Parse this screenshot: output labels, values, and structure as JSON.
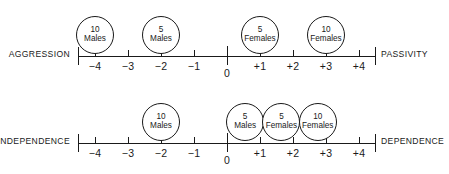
{
  "chart_data": {
    "type": "scatter",
    "title": "",
    "axis_range": [
      -4.5,
      4.5
    ],
    "grid": false,
    "legend": "none",
    "scales": [
      {
        "id": "aggression-passivity",
        "left_pole": "AGGRESSION",
        "right_pole": "PASSIVITY",
        "tick_values": [
          -4,
          -3,
          -2,
          -1,
          0,
          1,
          2,
          3,
          4
        ],
        "tick_labels": [
          "−4",
          "−3",
          "−2",
          "−1",
          "0",
          "+1",
          "+2",
          "+3",
          "+4"
        ],
        "groups": [
          {
            "count": "10",
            "group": "Males",
            "position": -4
          },
          {
            "count": "5",
            "group": "Males",
            "position": -2
          },
          {
            "count": "5",
            "group": "Females",
            "position": 1
          },
          {
            "count": "10",
            "group": "Females",
            "position": 3
          }
        ]
      },
      {
        "id": "independence-dependence",
        "left_pole": "INDEPENDENCE",
        "right_pole": "DEPENDENCE",
        "tick_values": [
          -4,
          -3,
          -2,
          -1,
          0,
          1,
          2,
          3,
          4
        ],
        "tick_labels": [
          "−4",
          "−3",
          "−2",
          "−1",
          "0",
          "+1",
          "+2",
          "+3",
          "+4"
        ],
        "groups": [
          {
            "count": "10",
            "group": "Males",
            "position": -2
          },
          {
            "count": "5",
            "group": "Males",
            "position": 0.55
          },
          {
            "count": "5",
            "group": "Females",
            "position": 1.65
          },
          {
            "count": "10",
            "group": "Females",
            "position": 2.75
          }
        ]
      }
    ]
  },
  "colors": {
    "ink": "#1a1a1a",
    "background": "#ffffff"
  }
}
